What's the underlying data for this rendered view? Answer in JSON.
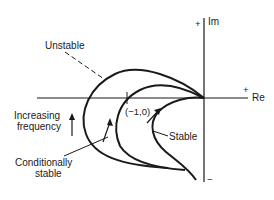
{
  "diagram": {
    "type": "nyquist-plot",
    "axes": {
      "real_label": "Re",
      "imag_label": "Im",
      "plus_sign": "+",
      "minus_sign": "−"
    },
    "point_label": "(−1,0)",
    "curves": [
      {
        "name": "unstable",
        "label": "Unstable"
      },
      {
        "name": "conditionally-stable",
        "label_line1": "Conditionally",
        "label_line2": "stable"
      },
      {
        "name": "stable",
        "label": "Stable"
      }
    ],
    "annotation": {
      "line1": "Increasing",
      "line2": "frequency"
    },
    "colors": {
      "ink": "#1a1a1a",
      "background": "#ffffff"
    }
  }
}
